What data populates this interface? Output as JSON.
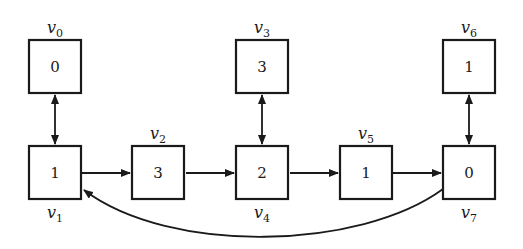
{
  "diagram": {
    "type": "graph",
    "nodes": [
      {
        "id": "v0",
        "label": "v",
        "sub": "0",
        "value": "0",
        "x": 29,
        "y": 40
      },
      {
        "id": "v1",
        "label": "v",
        "sub": "1",
        "value": "1",
        "x": 29,
        "y": 146
      },
      {
        "id": "v2",
        "label": "v",
        "sub": "2",
        "value": "3",
        "x": 132,
        "y": 146
      },
      {
        "id": "v3",
        "label": "v",
        "sub": "3",
        "value": "3",
        "x": 236,
        "y": 40
      },
      {
        "id": "v4",
        "label": "v",
        "sub": "4",
        "value": "2",
        "x": 236,
        "y": 146
      },
      {
        "id": "v5",
        "label": "v",
        "sub": "5",
        "value": "1",
        "x": 340,
        "y": 146
      },
      {
        "id": "v6",
        "label": "v",
        "sub": "6",
        "value": "1",
        "x": 443,
        "y": 40
      },
      {
        "id": "v7",
        "label": "v",
        "sub": "7",
        "value": "0",
        "x": 443,
        "y": 146
      }
    ],
    "edges": [
      {
        "from": "v0",
        "to": "v1",
        "direction": "bidirectional"
      },
      {
        "from": "v1",
        "to": "v2",
        "direction": "forward"
      },
      {
        "from": "v2",
        "to": "v4",
        "direction": "forward"
      },
      {
        "from": "v3",
        "to": "v4",
        "direction": "bidirectional"
      },
      {
        "from": "v4",
        "to": "v5",
        "direction": "forward"
      },
      {
        "from": "v5",
        "to": "v7",
        "direction": "forward"
      },
      {
        "from": "v6",
        "to": "v7",
        "direction": "bidirectional"
      },
      {
        "from": "v7",
        "to": "v1",
        "direction": "forward",
        "shape": "curved"
      }
    ]
  }
}
